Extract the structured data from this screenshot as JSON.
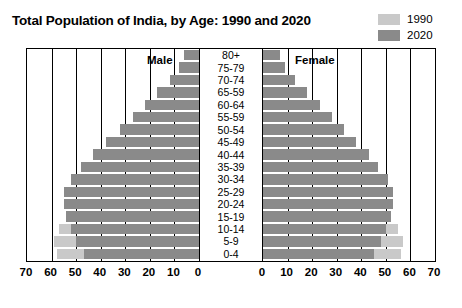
{
  "title": "Total Population of India, by Age: 1990 and 2020",
  "legend": {
    "items": [
      {
        "label": "1990",
        "color": "#c9c9c9",
        "name": "legend-swatch-1990"
      },
      {
        "label": "2020",
        "color": "#8a8a8a",
        "name": "legend-swatch-2020"
      }
    ]
  },
  "panels": {
    "male_label": "Male",
    "female_label": "Female"
  },
  "axis": {
    "left_ticks": [
      "70",
      "60",
      "50",
      "40",
      "30",
      "20",
      "10",
      "0"
    ],
    "right_ticks": [
      "0",
      "10",
      "20",
      "30",
      "40",
      "50",
      "60",
      "70"
    ]
  },
  "chart_data": {
    "type": "bar",
    "subtype": "population-pyramid",
    "title": "Total Population of India, by Age: 1990 and 2020",
    "xlabel": "",
    "ylabel": "",
    "xlim": [
      0,
      70
    ],
    "grid": true,
    "legend_position": "top-right",
    "units": "millions",
    "categories": [
      "80+",
      "75-79",
      "70-74",
      "65-59",
      "60-64",
      "55-59",
      "50-54",
      "45-49",
      "40-44",
      "35-39",
      "30-34",
      "25-29",
      "20-24",
      "15-19",
      "10-14",
      "5-9",
      "0-4"
    ],
    "series": [
      {
        "name": "1990",
        "side": "male",
        "color": "#c9c9c9",
        "values": [
          2,
          3,
          5,
          8,
          11,
          14,
          18,
          22,
          26,
          31,
          36,
          42,
          47,
          52,
          57,
          59,
          58
        ]
      },
      {
        "name": "2020",
        "side": "male",
        "color": "#8a8a8a",
        "values": [
          6,
          8,
          12,
          17,
          22,
          27,
          32,
          38,
          43,
          48,
          52,
          55,
          55,
          54,
          52,
          50,
          47
        ]
      },
      {
        "name": "1990",
        "side": "female",
        "color": "#c9c9c9",
        "values": [
          2,
          3,
          5,
          7,
          10,
          13,
          17,
          21,
          25,
          30,
          35,
          41,
          46,
          51,
          55,
          57,
          56
        ]
      },
      {
        "name": "2020",
        "side": "female",
        "color": "#8a8a8a",
        "values": [
          7,
          9,
          13,
          18,
          23,
          28,
          33,
          38,
          43,
          47,
          51,
          53,
          53,
          52,
          50,
          48,
          45
        ]
      }
    ]
  }
}
